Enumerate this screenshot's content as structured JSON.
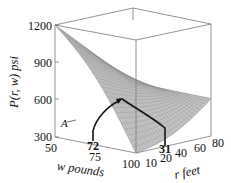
{
  "chart_data": {
    "type": "surface3d",
    "title": "",
    "zlabel": "P(r, w) psi",
    "xlabel": "w pounds",
    "ylabel": "r feet",
    "z_ticks": [
      "1200",
      "900",
      "600",
      "300"
    ],
    "z_range": [
      300,
      1200
    ],
    "w_ticks": [
      "50",
      "75",
      "100"
    ],
    "w_range": [
      50,
      100
    ],
    "r_ticks": [
      "10",
      "20",
      "40",
      "60",
      "80"
    ],
    "r_range": [
      10,
      80
    ],
    "surface_corners": {
      "w50_r10": 1200,
      "w100_r10": 300,
      "w50_r80": 600,
      "w100_r80": 600
    },
    "annotations": [
      {
        "label": "A",
        "type": "point-label"
      },
      {
        "label": "72",
        "axis": "w",
        "value": 72
      },
      {
        "label": "31",
        "axis": "r",
        "value": 31
      }
    ],
    "surface_color": "#c4c4c4",
    "grid_color": "#8e8e8e"
  }
}
